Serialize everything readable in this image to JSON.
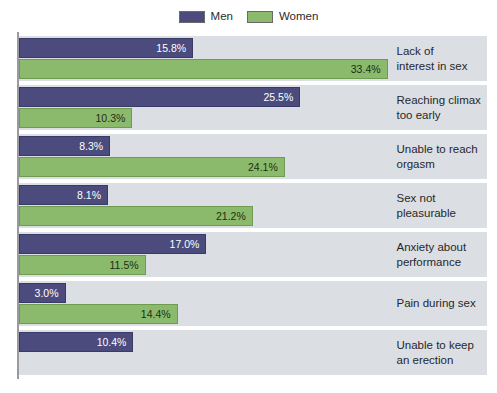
{
  "legend": {
    "entries": [
      {
        "label": "Men",
        "color": "#4b4b7d",
        "icon": "square-swatch-icon"
      },
      {
        "label": "Women",
        "color": "#8cba6c",
        "icon": "square-swatch-icon"
      }
    ]
  },
  "chart_data": {
    "type": "bar",
    "orientation": "horizontal",
    "title": "",
    "subtitle": "",
    "xlabel": "",
    "ylabel": "",
    "xlim": [
      0,
      34.2
    ],
    "grid": false,
    "legend_position": "top-center",
    "value_format": "percent-one-decimal",
    "categories": [
      "Lack of interest in sex",
      "Reaching climax too early",
      "Unable to reach orgasm",
      "Sex not pleasurable",
      "Anxiety about performance",
      "Pain during sex",
      "Unable to keep an erection"
    ],
    "series": [
      {
        "name": "Men",
        "color": "#4b4b7d",
        "values": [
          15.8,
          25.5,
          8.3,
          8.1,
          17.0,
          3.0,
          10.4
        ],
        "labels": [
          "15.8%",
          "25.5%",
          "8.3%",
          "8.1%",
          "17.0%",
          "3.0%",
          "10.4%"
        ]
      },
      {
        "name": "Women",
        "color": "#8cba6c",
        "values": [
          33.4,
          10.3,
          24.1,
          21.2,
          11.5,
          14.4,
          null
        ],
        "labels": [
          "33.4%",
          "10.3%",
          "24.1%",
          "21.2%",
          "11.5%",
          "14.4%",
          null
        ]
      }
    ],
    "groups": [
      {
        "category": "Lack of interest in sex",
        "category_lines": [
          "Lack of",
          "interest in sex"
        ],
        "men": {
          "value": 15.8,
          "label": "15.8%"
        },
        "women": {
          "value": 33.4,
          "label": "33.4%"
        }
      },
      {
        "category": "Reaching climax too early",
        "category_lines": [
          "Reaching climax",
          "too early"
        ],
        "men": {
          "value": 25.5,
          "label": "25.5%"
        },
        "women": {
          "value": 10.3,
          "label": "10.3%"
        }
      },
      {
        "category": "Unable to reach orgasm",
        "category_lines": [
          "Unable to reach",
          "orgasm"
        ],
        "men": {
          "value": 8.3,
          "label": "8.3%"
        },
        "women": {
          "value": 24.1,
          "label": "24.1%"
        }
      },
      {
        "category": "Sex not pleasurable",
        "category_lines": [
          "Sex not",
          "pleasurable"
        ],
        "men": {
          "value": 8.1,
          "label": "8.1%"
        },
        "women": {
          "value": 21.2,
          "label": "21.2%"
        }
      },
      {
        "category": "Anxiety about performance",
        "category_lines": [
          "Anxiety about",
          "performance"
        ],
        "men": {
          "value": 17.0,
          "label": "17.0%"
        },
        "women": {
          "value": 11.5,
          "label": "11.5%"
        }
      },
      {
        "category": "Pain during sex",
        "category_lines": [
          "Pain during sex"
        ],
        "men": {
          "value": 3.0,
          "label": "3.0%"
        },
        "women": {
          "value": 14.4,
          "label": "14.4%"
        }
      },
      {
        "category": "Unable to keep an erection",
        "category_lines": [
          "Unable to keep",
          "an erection"
        ],
        "men": {
          "value": 10.4,
          "label": "10.4%"
        },
        "women": {
          "value": null,
          "label": null
        }
      }
    ]
  }
}
